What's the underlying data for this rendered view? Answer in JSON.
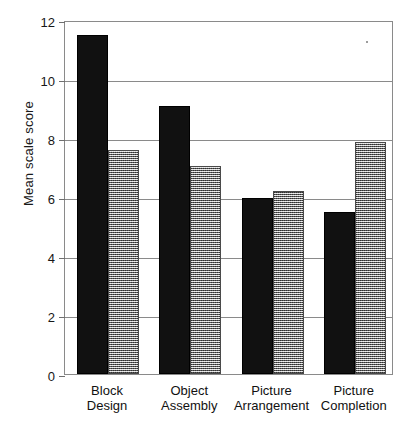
{
  "chart_data": {
    "type": "bar",
    "title": "",
    "xlabel": "",
    "ylabel": "Mean scale score",
    "ylim": [
      0,
      12
    ],
    "yticks": [
      0,
      2,
      4,
      6,
      8,
      10,
      12
    ],
    "ytick_labels": [
      "0",
      "2",
      "4",
      "6",
      "8",
      "10",
      "12"
    ],
    "grid": "horizontal",
    "legend": "none",
    "categories": [
      "Block\nDesign",
      "Object\nAssembly",
      "Picture\nArrangement",
      "Picture\nCompletion"
    ],
    "category_labels_flat": [
      "Block Design",
      "Object Assembly",
      "Picture Arrangement",
      "Picture Completion"
    ],
    "series": [
      {
        "name": "series-1",
        "style": "solid-black",
        "color": "#111111",
        "values": [
          11.5,
          9.1,
          5.95,
          5.5
        ]
      },
      {
        "name": "series-2",
        "style": "gray-hatched",
        "color": "#9b9b9b",
        "values": [
          7.6,
          7.05,
          6.2,
          7.85
        ]
      }
    ]
  },
  "axis": {
    "frame_color": "#8a8a8a",
    "tick_color": "#6f6f6f"
  }
}
